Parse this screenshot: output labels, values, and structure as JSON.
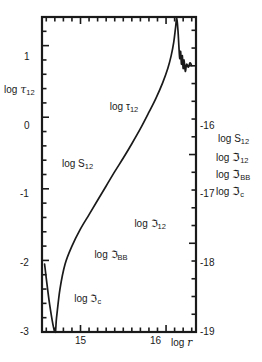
{
  "chart_data": {
    "type": "line",
    "title": "",
    "xlabel": "log r",
    "ylabel_left": "log τ₁₂",
    "ylabel_right": "log S₁₂ / log ℑ₁₂ / log ℑ_BB / log ℑ_c",
    "xlim": [
      14.55,
      16.35
    ],
    "ylim_left": [
      -3,
      1.4
    ],
    "ylim_right": [
      -19,
      -15.45
    ],
    "grid": false,
    "legend": "inline-curve-labels",
    "x_ticks_major": [
      15,
      16
    ],
    "x_tick_labels": [
      "15",
      "16"
    ],
    "y_ticks_left": [
      1,
      0,
      -1,
      -2,
      -3
    ],
    "y_tick_labels_left": [
      "1",
      "0",
      "-1",
      "-2",
      "-3"
    ],
    "y_ticks_right": [
      -16,
      -17,
      -18,
      -19
    ],
    "y_tick_labels_right": [
      "-16",
      "-17",
      "-18",
      "-19"
    ],
    "series": [
      {
        "name": "log τ₁₂",
        "axis": "left",
        "label_text": "log τ",
        "label_sub": "12",
        "points": [
          [
            14.58,
            -2.05
          ],
          [
            14.64,
            -2.62
          ],
          [
            14.7,
            -3.0
          ],
          [
            14.72,
            -2.8
          ],
          [
            14.76,
            -2.4
          ],
          [
            14.82,
            -2.05
          ],
          [
            14.9,
            -1.8
          ],
          [
            15.0,
            -1.56
          ],
          [
            15.1,
            -1.36
          ],
          [
            15.2,
            -1.16
          ],
          [
            15.3,
            -0.96
          ],
          [
            15.4,
            -0.76
          ],
          [
            15.5,
            -0.57
          ],
          [
            15.6,
            -0.37
          ],
          [
            15.7,
            -0.16
          ],
          [
            15.8,
            0.07
          ],
          [
            15.88,
            0.26
          ],
          [
            15.96,
            0.48
          ],
          [
            16.02,
            0.68
          ],
          [
            16.06,
            0.86
          ],
          [
            16.09,
            1.05
          ],
          [
            16.11,
            1.24
          ],
          [
            16.125,
            1.38
          ],
          [
            16.14,
            1.2
          ],
          [
            16.15,
            0.99
          ],
          [
            16.16,
            0.82
          ],
          [
            16.17,
            0.92
          ],
          [
            16.18,
            0.74
          ],
          [
            16.19,
            0.86
          ],
          [
            16.2,
            0.68
          ],
          [
            16.21,
            0.8
          ],
          [
            16.225,
            0.64
          ],
          [
            16.24,
            0.74
          ],
          [
            16.26,
            0.7
          ],
          [
            16.28,
            0.76
          ],
          [
            16.3,
            0.72
          ]
        ]
      },
      {
        "name": "log S₁₂",
        "axis": "right",
        "label_text": "log S",
        "label_sub": "12",
        "points": [
          [
            14.58,
            -0.55
          ],
          [
            14.64,
            -0.68
          ],
          [
            14.7,
            -0.79
          ],
          [
            14.78,
            -0.89
          ],
          [
            14.86,
            -0.97
          ],
          [
            14.95,
            -1.04
          ],
          [
            15.05,
            -1.09
          ],
          [
            15.16,
            -1.13
          ],
          [
            15.28,
            -1.16
          ],
          [
            15.42,
            -1.18
          ],
          [
            15.58,
            -1.19
          ],
          [
            15.78,
            -1.2
          ],
          [
            16.0,
            -1.2
          ],
          [
            16.15,
            -1.2
          ],
          [
            16.24,
            -1.21
          ],
          [
            16.28,
            -1.28
          ],
          [
            16.31,
            -1.45
          ],
          [
            16.33,
            -1.58
          ]
        ]
      },
      {
        "name": "log ℑ₁₂",
        "axis": "right",
        "label_text": "log ℑ",
        "label_sub": "12",
        "points": [
          [
            14.58,
            -1.56
          ],
          [
            14.72,
            -1.55
          ],
          [
            14.9,
            -1.54
          ],
          [
            15.1,
            -1.52
          ],
          [
            15.3,
            -1.49
          ],
          [
            15.5,
            -1.45
          ],
          [
            15.7,
            -1.4
          ],
          [
            15.88,
            -1.35
          ],
          [
            16.02,
            -1.3
          ],
          [
            16.12,
            -1.26
          ],
          [
            16.19,
            -1.23
          ],
          [
            16.24,
            -1.21
          ],
          [
            16.27,
            -1.24
          ],
          [
            16.3,
            -1.4
          ],
          [
            16.33,
            -1.58
          ]
        ]
      },
      {
        "name": "log ℑ_BB",
        "axis": "right",
        "label_text": "log ℑ",
        "label_sub": "BB",
        "points": [
          [
            14.58,
            -1.65
          ],
          [
            14.75,
            -1.655
          ],
          [
            14.95,
            -1.67
          ],
          [
            15.15,
            -1.7
          ],
          [
            15.35,
            -1.75
          ],
          [
            15.52,
            -1.82
          ],
          [
            15.68,
            -1.9
          ],
          [
            15.82,
            -2.0
          ],
          [
            15.94,
            -2.12
          ],
          [
            16.04,
            -2.26
          ],
          [
            16.12,
            -2.42
          ],
          [
            16.18,
            -2.58
          ],
          [
            16.225,
            -2.76
          ],
          [
            16.25,
            -2.9
          ],
          [
            16.262,
            -2.8
          ],
          [
            16.272,
            -2.45
          ],
          [
            16.282,
            -2.1
          ],
          [
            16.29,
            -1.85
          ],
          [
            16.3,
            -1.74
          ],
          [
            16.315,
            -1.7
          ],
          [
            16.33,
            -1.69
          ]
        ]
      },
      {
        "name": "log ℑ_c",
        "axis": "right",
        "label_text": "log ℑ",
        "label_sub": "c",
        "points": [
          [
            14.58,
            -2.05
          ],
          [
            14.66,
            -2.28
          ],
          [
            14.74,
            -2.5
          ],
          [
            14.82,
            -2.7
          ],
          [
            14.9,
            -2.87
          ],
          [
            14.96,
            -3.0
          ]
        ]
      }
    ],
    "inline_labels": [
      {
        "name": "tau12-curve-label",
        "text": "log τ",
        "sub": "12",
        "x": 0.44,
        "y": 0.27
      },
      {
        "name": "s12-curve-label",
        "text": "log S",
        "sub": "12",
        "x": 0.13,
        "y": 0.45
      },
      {
        "name": "j12-curve-label",
        "text": "log ℑ",
        "sub": "12",
        "x": 0.6,
        "y": 0.64
      },
      {
        "name": "jbb-curve-label",
        "text": "log ℑ",
        "sub": "BB",
        "x": 0.34,
        "y": 0.74
      },
      {
        "name": "jc-curve-label",
        "text": "log ℑ",
        "sub": "c",
        "x": 0.21,
        "y": 0.88
      }
    ]
  },
  "axes": {
    "left_title": {
      "prefix": "log ",
      "symbol": "τ",
      "sub": "12"
    },
    "x_title": {
      "prefix": "log ",
      "symbol": "r"
    },
    "right_titles": [
      {
        "prefix": "log ",
        "symbol": "S",
        "sub": "12"
      },
      {
        "prefix": "log ",
        "symbol": "ℑ",
        "sub": "12"
      },
      {
        "prefix": "log ",
        "symbol": "ℑ",
        "sub": "BB"
      },
      {
        "prefix": "log ",
        "symbol": "ℑ",
        "sub": "c"
      }
    ],
    "left_ticks": [
      "1",
      "0",
      "-1",
      "-2",
      "-3"
    ],
    "right_ticks": [
      "-16",
      "-17",
      "-18",
      "-19"
    ],
    "x_ticks": [
      "15",
      "16"
    ]
  },
  "style": {
    "line_color": "#1a1a1a",
    "frame_color": "#1a1a1a",
    "background": "#ffffff"
  }
}
